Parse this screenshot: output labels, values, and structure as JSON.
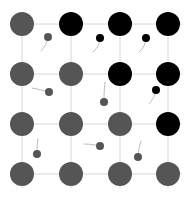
{
  "diagram": {
    "type": "lattice",
    "grid": {
      "rows": 4,
      "cols": 4,
      "x": [
        22,
        71,
        120,
        168
      ],
      "y": [
        24,
        74,
        124,
        174
      ],
      "line_color": "#d6d6d6"
    },
    "colors": {
      "gray": "#555555",
      "black": "#000000",
      "tail": "#bdbdbd"
    },
    "large_radius": 12,
    "small_radius": 4,
    "large_sites": [
      [
        "gray",
        "black",
        "black",
        "black"
      ],
      [
        "gray",
        "gray",
        "black",
        "black"
      ],
      [
        "gray",
        "gray",
        "gray",
        "black"
      ],
      [
        "gray",
        "gray",
        "gray",
        "gray"
      ]
    ],
    "small_particles": [
      {
        "x": 48,
        "y": 37,
        "color": "gray",
        "tail": [
          [
            48,
            41
          ],
          [
            45,
            47
          ],
          [
            41,
            51
          ]
        ]
      },
      {
        "x": 100,
        "y": 38,
        "color": "black",
        "tail": [
          [
            100,
            42
          ],
          [
            98,
            48
          ],
          [
            93,
            52
          ]
        ]
      },
      {
        "x": 146,
        "y": 38,
        "color": "black",
        "tail": [
          [
            146,
            42
          ],
          [
            144,
            48
          ],
          [
            139,
            52
          ]
        ]
      },
      {
        "x": 49,
        "y": 92,
        "color": "gray",
        "tail": [
          [
            45,
            91
          ],
          [
            38,
            89
          ],
          [
            32,
            88
          ]
        ]
      },
      {
        "x": 104,
        "y": 102,
        "color": "gray",
        "tail": [
          [
            104,
            98
          ],
          [
            104,
            90
          ],
          [
            105,
            82
          ]
        ]
      },
      {
        "x": 156,
        "y": 90,
        "color": "black",
        "tail": [
          [
            156,
            94
          ],
          [
            153,
            99
          ],
          [
            149,
            104
          ]
        ]
      },
      {
        "x": 37,
        "y": 154,
        "color": "gray",
        "tail": [
          [
            37,
            150
          ],
          [
            37,
            144
          ],
          [
            38,
            139
          ]
        ]
      },
      {
        "x": 100,
        "y": 146,
        "color": "gray",
        "tail": [
          [
            96,
            145
          ],
          [
            90,
            144
          ],
          [
            84,
            144
          ]
        ]
      },
      {
        "x": 138,
        "y": 157,
        "color": "gray",
        "tail": [
          [
            138,
            153
          ],
          [
            139,
            147
          ],
          [
            141,
            141
          ]
        ]
      }
    ]
  }
}
